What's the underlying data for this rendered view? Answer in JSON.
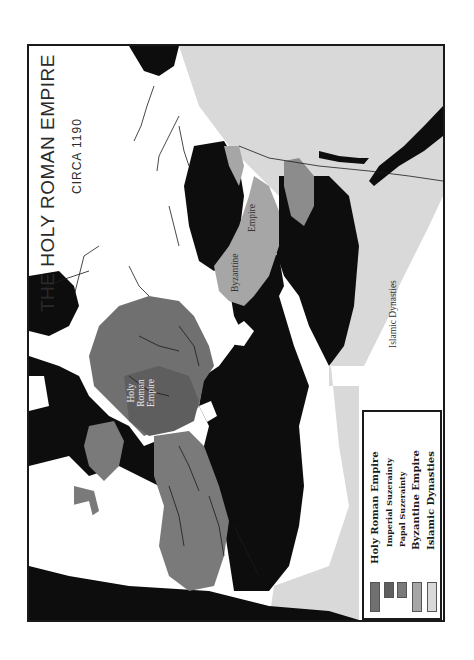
{
  "map": {
    "title": "The Holy Roman Empire",
    "title_display": "THE HOLY ROMAN EMPIRE",
    "subtitle": "CIRCA 1190",
    "colors": {
      "sea": "#0d0d0d",
      "unclaimed_land": "#ffffff",
      "holy_roman_empire": "#707070",
      "imperial_suzerainty": "#5e5e5e",
      "papal_suzerainty": "#7a7a7a",
      "byzantine_empire": "#a6a6a6",
      "islamic_dynasties": "#d9d9d9",
      "border": "#1a1a1a"
    },
    "region_labels": {
      "hre": [
        "Holy",
        "Roman",
        "Empire"
      ],
      "byzantine": [
        "Byzantine",
        "Empire"
      ],
      "islamic": "Islamic Dynasties"
    }
  },
  "legend": {
    "items": [
      {
        "label": "Holy Roman Empire",
        "color": "#707070",
        "size": "large"
      },
      {
        "label": "Imperial Suzerainty",
        "color": "#5e5e5e",
        "size": "small"
      },
      {
        "label": "Papal Suzerainty",
        "color": "#7a7a7a",
        "size": "small"
      },
      {
        "label": "Byzantine Empire",
        "color": "#a6a6a6",
        "size": "large"
      },
      {
        "label": "Islamic Dynasties",
        "color": "#d9d9d9",
        "size": "large"
      }
    ]
  }
}
